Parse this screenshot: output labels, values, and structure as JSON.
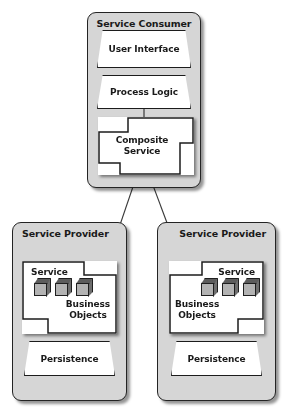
{
  "diagram": {
    "background_color": "#ffffff",
    "container_fill": "#d6d6d6",
    "shape_fill": "#ffffff",
    "stroke_color": "#242424",
    "cube_front_color": "#b3b3b3",
    "cube_top_color": "#5c5c5c",
    "cube_side_color": "#6e6e6e"
  },
  "consumer": {
    "title": "Service Consumer",
    "layers": [
      {
        "label": "User Interface",
        "shape": "trapezoid"
      },
      {
        "label": "Process Logic",
        "shape": "trapezoid"
      }
    ],
    "composite": {
      "label": "Composite\nService",
      "shape": "notched-component"
    }
  },
  "providers": [
    {
      "title": "Service Provider",
      "service": {
        "label": "Service",
        "shape": "notched-component",
        "business_objects_label": "Business\nObjects",
        "cube_count": 3
      },
      "persistence": {
        "label": "Persistence",
        "shape": "trapezoid"
      }
    },
    {
      "title": "Service Provider",
      "service": {
        "label": "Service",
        "shape": "notched-component",
        "business_objects_label": "Business\nObjects",
        "cube_count": 3
      },
      "persistence": {
        "label": "Persistence",
        "shape": "trapezoid"
      }
    }
  ],
  "connectors": [
    {
      "from": "composite-service",
      "to": "service-provider-left-service"
    },
    {
      "from": "composite-service",
      "to": "service-provider-right-service"
    },
    {
      "from": "process-logic",
      "to": "composite-service"
    }
  ]
}
